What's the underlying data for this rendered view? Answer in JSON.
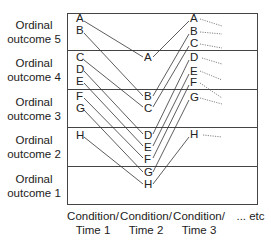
{
  "y_axis": {
    "categories": [
      {
        "label_line1": "Ordinal",
        "label_line2": "outcome 5"
      },
      {
        "label_line1": "Ordinal",
        "label_line2": "outcome 4"
      },
      {
        "label_line1": "Ordinal",
        "label_line2": "outcome 3"
      },
      {
        "label_line1": "Ordinal",
        "label_line2": "outcome 2"
      },
      {
        "label_line1": "Ordinal",
        "label_line2": "outcome 1"
      }
    ]
  },
  "x_axis": {
    "columns": [
      {
        "line1": "Condition/",
        "line2": "Time 1"
      },
      {
        "line1": "Condition/",
        "line2": "Time 2"
      },
      {
        "line1": "Condition/",
        "line2": "Time 3"
      }
    ],
    "etc_label": "... etc"
  },
  "subjects": [
    "A",
    "B",
    "C",
    "D",
    "E",
    "F",
    "G",
    "H"
  ],
  "columns_data": [
    {
      "name": "Time 1",
      "order": [
        "A",
        "B",
        "C",
        "D",
        "E",
        "F",
        "G",
        "H"
      ]
    },
    {
      "name": "Time 2",
      "order": [
        "A",
        "B",
        "C",
        "D",
        "E",
        "F",
        "G",
        "H"
      ]
    },
    {
      "name": "Time 3",
      "order": [
        "A",
        "B",
        "C",
        "D",
        "E",
        "F",
        "G",
        "H"
      ]
    }
  ],
  "colors": {
    "line": "#333333",
    "border": "#444444",
    "dotted": "#666666"
  }
}
